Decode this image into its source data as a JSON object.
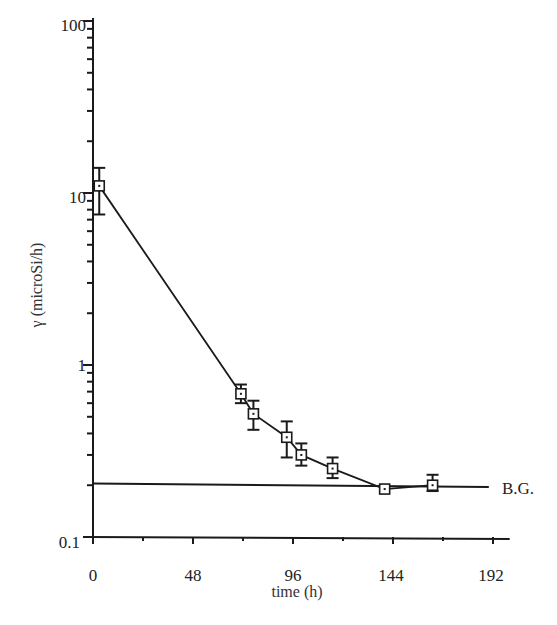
{
  "chart_data": {
    "type": "line",
    "title": "",
    "xlabel": "time (h)",
    "ylabel": "γ (microSi/h)",
    "xscale": "linear",
    "yscale": "log",
    "xlim": [
      0,
      200
    ],
    "ylim": [
      0.1,
      100
    ],
    "x_ticks": [
      0,
      48,
      96,
      144,
      192
    ],
    "x_tick_labels": [
      "0",
      "48",
      "96",
      "144",
      "192"
    ],
    "y_ticks": [
      0.1,
      1,
      10,
      100
    ],
    "y_tick_labels": [
      "0.1",
      "1",
      "10",
      "100"
    ],
    "grid": false,
    "legend": null,
    "series": [
      {
        "name": "γ measurements",
        "marker": "open-square",
        "line": "solid",
        "x": [
          3,
          71,
          77,
          93,
          100,
          115,
          140,
          163
        ],
        "y": [
          11,
          0.68,
          0.52,
          0.38,
          0.3,
          0.25,
          0.19,
          0.2
        ],
        "y_err_low": [
          7.5,
          0.6,
          0.42,
          0.29,
          0.26,
          0.22,
          0.19,
          0.185
        ],
        "y_err_high": [
          14,
          0.77,
          0.62,
          0.47,
          0.35,
          0.29,
          0.19,
          0.23
        ]
      },
      {
        "name": "B.G.",
        "line": "solid",
        "x": [
          0,
          190
        ],
        "y": [
          0.205,
          0.195
        ]
      }
    ],
    "annotations": [
      {
        "text": "B.G.",
        "x": 195,
        "y": 0.195
      }
    ]
  },
  "labels": {
    "xlabel": "time (h)",
    "ylabel": "γ (microSi/h)",
    "bg": "B.G.",
    "y_ticks": [
      "100",
      "10",
      "1",
      "0.1"
    ],
    "x_ticks": [
      "0",
      "48",
      "96",
      "144",
      "192"
    ]
  }
}
